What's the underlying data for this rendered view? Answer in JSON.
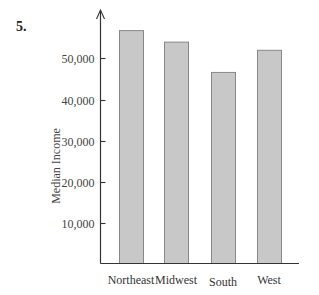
{
  "question_number": "5.",
  "chart_data": {
    "type": "bar",
    "title": "",
    "xlabel": "",
    "ylabel": "Median Income",
    "categories": [
      "Northeast",
      "Midwest",
      "South",
      "West"
    ],
    "values": [
      56800,
      54000,
      46600,
      52000
    ],
    "ylim": [
      0,
      60000
    ],
    "yticks": [
      10000,
      20000,
      30000,
      40000,
      50000
    ],
    "ytick_labels": [
      "10,000",
      "20,000",
      "30,000",
      "40,000",
      "50,000"
    ],
    "grid": false,
    "legend": null,
    "colors": {
      "bar_fill": "#c8c8c8",
      "bar_stroke": "#888888",
      "axis": "#333333"
    }
  }
}
